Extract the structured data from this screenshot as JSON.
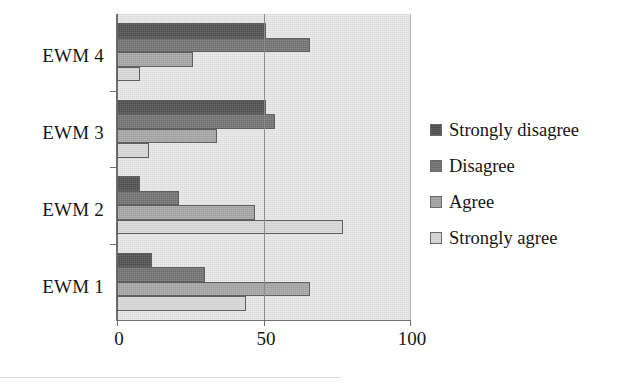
{
  "chart_data": {
    "type": "bar",
    "orientation": "horizontal",
    "title": "",
    "xlabel": "",
    "ylabel": "",
    "categories": [
      "EWM 4",
      "EWM 3",
      "EWM 2",
      "EWM 1"
    ],
    "series": [
      {
        "name": "Strongly disagree",
        "color": "#4a4a4a",
        "values": [
          51,
          51,
          8,
          12
        ]
      },
      {
        "name": "Disagree",
        "color": "#6b6b6b",
        "values": [
          66,
          54,
          21,
          30
        ]
      },
      {
        "name": "Agree",
        "color": "#9c9c9c",
        "values": [
          26,
          34,
          47,
          66
        ]
      },
      {
        "name": "Strongly agree",
        "color": "#cfcfcf",
        "values": [
          8,
          11,
          77,
          44
        ]
      }
    ],
    "xlim": [
      0,
      100
    ],
    "xticks": [
      0,
      50,
      100
    ],
    "xtick_labels": [
      "0",
      "50",
      "100"
    ],
    "gridlines": [
      50
    ],
    "grid": true,
    "legend_position": "right",
    "plot_background": "#e2e2e2"
  },
  "axis": {
    "x_tick_0": "0",
    "x_tick_50": "50",
    "x_tick_100": "100"
  },
  "categories": {
    "c0": "EWM 4",
    "c1": "EWM 3",
    "c2": "EWM 2",
    "c3": "EWM 1"
  },
  "legend": {
    "items": [
      {
        "label": "Strongly disagree"
      },
      {
        "label": "Disagree"
      },
      {
        "label": "Agree"
      },
      {
        "label": "Strongly agree"
      }
    ]
  }
}
